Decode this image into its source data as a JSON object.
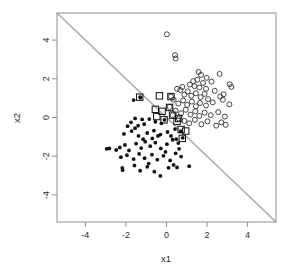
{
  "chart_data": {
    "type": "scatter",
    "title": "",
    "xlabel": "x1",
    "ylabel": "x2",
    "xlim": [
      -5.4,
      5.4
    ],
    "ylim": [
      -5.4,
      5.4
    ],
    "grid": false,
    "legend": "none",
    "xticks": [
      -4,
      -2,
      0,
      2,
      4
    ],
    "yticks": [
      -4,
      -2,
      0,
      2,
      4
    ],
    "xtick_labels": [
      "-4",
      "-2",
      "0",
      "2",
      "4"
    ],
    "ytick_labels": [
      "-4",
      "-2",
      "0",
      "2",
      "4"
    ],
    "annotations": {
      "decision_boundary": {
        "description": "gray diagonal separating line x2 = -x1",
        "from": [
          -5.4,
          5.4
        ],
        "to": [
          5.4,
          -5.4
        ],
        "color": "#aaaaaa"
      },
      "support_vector_marker": "square outline around point"
    },
    "series": [
      {
        "name": "class-negative",
        "marker": "filled-circle",
        "color": "#111111",
        "points": [
          [
            -1.62,
            0.9
          ],
          [
            -1.3,
            1.05
          ],
          [
            -1.28,
            1.02
          ],
          [
            -1.55,
            -0.05
          ],
          [
            -1.2,
            -0.1
          ],
          [
            -0.85,
            -0.08
          ],
          [
            -1.92,
            -0.45
          ],
          [
            -1.55,
            -0.55
          ],
          [
            -1.1,
            -0.35
          ],
          [
            -0.55,
            -0.22
          ],
          [
            -0.25,
            -0.3
          ],
          [
            -0.1,
            -0.12
          ],
          [
            -2.1,
            -0.85
          ],
          [
            -1.72,
            -0.7
          ],
          [
            -1.38,
            -0.95
          ],
          [
            -0.95,
            -0.8
          ],
          [
            -0.62,
            -0.68
          ],
          [
            -0.3,
            -0.88
          ],
          [
            0.05,
            -0.75
          ],
          [
            0.42,
            -0.6
          ],
          [
            0.7,
            -0.72
          ],
          [
            -2.95,
            -1.62
          ],
          [
            -2.82,
            -1.6
          ],
          [
            -2.3,
            -1.55
          ],
          [
            -2.05,
            -1.42
          ],
          [
            -1.85,
            -1.7
          ],
          [
            -1.5,
            -1.35
          ],
          [
            -1.25,
            -1.58
          ],
          [
            -1.05,
            -1.25
          ],
          [
            -0.8,
            -1.48
          ],
          [
            -0.55,
            -1.3
          ],
          [
            -0.28,
            -1.6
          ],
          [
            0.02,
            -1.38
          ],
          [
            0.3,
            -1.15
          ],
          [
            0.58,
            -1.32
          ],
          [
            0.8,
            -1.05
          ],
          [
            -2.25,
            -2.05
          ],
          [
            -1.95,
            -1.95
          ],
          [
            -1.62,
            -2.15
          ],
          [
            -1.35,
            -1.88
          ],
          [
            -1.08,
            -2.1
          ],
          [
            -0.72,
            -1.92
          ],
          [
            -0.45,
            -2.18
          ],
          [
            -0.15,
            -1.98
          ],
          [
            0.18,
            -2.22
          ],
          [
            0.45,
            -1.85
          ],
          [
            0.72,
            -2.02
          ],
          [
            -2.18,
            -2.6
          ],
          [
            -2.16,
            -2.72
          ],
          [
            -1.58,
            -2.48
          ],
          [
            -1.3,
            -2.75
          ],
          [
            -0.95,
            -2.55
          ],
          [
            -0.6,
            -2.8
          ],
          [
            -0.3,
            -3.02
          ],
          [
            0.1,
            -2.6
          ],
          [
            0.52,
            -2.58
          ],
          [
            1.12,
            -2.52
          ],
          [
            -1.75,
            -0.25
          ],
          [
            -1.4,
            -0.42
          ],
          [
            -0.7,
            -1.08
          ],
          [
            -0.42,
            -0.95
          ],
          [
            0.22,
            -0.95
          ],
          [
            0.48,
            -1.12
          ],
          [
            -2.48,
            -1.68
          ],
          [
            -0.05,
            -1.78
          ],
          [
            0.35,
            -2.45
          ],
          [
            -1.15,
            -1.12
          ],
          [
            -0.88,
            -2.38
          ],
          [
            0.62,
            -1.62
          ]
        ]
      },
      {
        "name": "class-positive",
        "marker": "open-circle",
        "color": "#333333",
        "points": [
          [
            0.02,
            4.3
          ],
          [
            0.42,
            3.22
          ],
          [
            0.45,
            3.05
          ],
          [
            1.58,
            2.35
          ],
          [
            1.7,
            2.2
          ],
          [
            2.62,
            2.25
          ],
          [
            1.15,
            1.7
          ],
          [
            1.38,
            1.62
          ],
          [
            1.52,
            1.95
          ],
          [
            1.62,
            1.55
          ],
          [
            1.8,
            1.78
          ],
          [
            1.95,
            1.48
          ],
          [
            3.12,
            1.72
          ],
          [
            3.2,
            1.58
          ],
          [
            0.52,
            1.48
          ],
          [
            0.68,
            1.42
          ],
          [
            0.88,
            1.18
          ],
          [
            1.05,
            1.35
          ],
          [
            1.22,
            1.12
          ],
          [
            1.45,
            1.25
          ],
          [
            1.68,
            1.05
          ],
          [
            1.88,
            1.22
          ],
          [
            2.05,
            0.95
          ],
          [
            2.65,
            1.08
          ],
          [
            2.78,
            0.92
          ],
          [
            2.82,
            1.2
          ],
          [
            0.35,
            0.92
          ],
          [
            0.58,
            0.72
          ],
          [
            0.82,
            0.88
          ],
          [
            1.02,
            0.65
          ],
          [
            1.25,
            0.82
          ],
          [
            1.45,
            0.58
          ],
          [
            1.65,
            0.75
          ],
          [
            1.95,
            0.62
          ],
          [
            2.28,
            0.78
          ],
          [
            3.1,
            0.68
          ],
          [
            0.45,
            0.35
          ],
          [
            0.72,
            0.22
          ],
          [
            0.95,
            0.4
          ],
          [
            1.18,
            0.15
          ],
          [
            1.42,
            0.32
          ],
          [
            1.62,
            0.08
          ],
          [
            1.88,
            0.25
          ],
          [
            2.18,
            0.12
          ],
          [
            2.55,
            0.28
          ],
          [
            2.88,
            0.05
          ],
          [
            0.88,
            -0.18
          ],
          [
            1.12,
            -0.3
          ],
          [
            1.4,
            -0.12
          ],
          [
            1.72,
            -0.35
          ],
          [
            2.02,
            -0.2
          ],
          [
            2.45,
            -0.42
          ],
          [
            2.7,
            -0.25
          ],
          [
            2.92,
            -0.38
          ],
          [
            0.22,
            1.08
          ],
          [
            0.15,
            0.55
          ],
          [
            0.3,
            0.12
          ],
          [
            0.6,
            -0.05
          ],
          [
            1.32,
            1.88
          ],
          [
            2.22,
            1.85
          ],
          [
            0.78,
            1.58
          ],
          [
            2.38,
            1.38
          ],
          [
            1.98,
            2.05
          ]
        ]
      },
      {
        "name": "support-vectors",
        "marker": "square-outline",
        "color": "#111111",
        "points": [
          [
            -1.32,
            1.05
          ],
          [
            -0.35,
            1.12
          ],
          [
            0.22,
            1.08
          ],
          [
            -0.55,
            0.42
          ],
          [
            -0.48,
            0.05
          ],
          [
            0.15,
            0.52
          ],
          [
            -0.12,
            -0.12
          ],
          [
            0.3,
            0.12
          ],
          [
            0.6,
            -0.05
          ],
          [
            0.72,
            -0.62
          ],
          [
            0.78,
            -1.08
          ],
          [
            0.95,
            -0.7
          ],
          [
            0.52,
            -0.2
          ],
          [
            -0.22,
            0.32
          ]
        ]
      }
    ]
  },
  "axes": {
    "x_title": "x1",
    "y_title": "x2"
  }
}
